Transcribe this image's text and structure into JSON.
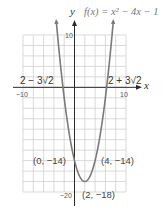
{
  "chart_data": {
    "type": "line",
    "function": "x^2 - 4x - 14",
    "xlabel": "x",
    "ylabel": "y",
    "xlim": [
      -10,
      10
    ],
    "ylim": [
      -20,
      10
    ],
    "grid": true,
    "grid_step": 2,
    "x_tick_labels": [
      {
        "value": -10,
        "label": "−10"
      },
      {
        "value": 10,
        "label": "10"
      }
    ],
    "y_tick_labels": [
      {
        "value": 10,
        "label": "10"
      },
      {
        "value": -20,
        "label": "−20"
      }
    ],
    "series": [
      {
        "name": "f(x) = x² − 4x − 14",
        "x_range": [
          -3.54,
          7.54
        ],
        "vertex": [
          2,
          -18
        ]
      }
    ],
    "annotations": [
      {
        "text": "2 − 3√2",
        "x": -2.24,
        "y": 0
      },
      {
        "text": "2 + 3√2",
        "x": 6.24,
        "y": 0
      },
      {
        "text": "(0, −14)",
        "x": 0,
        "y": -14
      },
      {
        "text": "(4, −14)",
        "x": 4,
        "y": -14
      },
      {
        "text": "(2, −18)",
        "x": 2,
        "y": -18
      }
    ]
  },
  "labels": {
    "y_axis": "y",
    "x_axis": "x",
    "function": "f(x) = x² − 4x − 1",
    "root_left": "2 − 3√2",
    "root_right": "2 + 3√2",
    "x_tick_min": "−10",
    "x_tick_max": "10",
    "y_tick_max": "10",
    "y_tick_min": "−20",
    "point_left": "(0, −14)",
    "point_right": "(4, −14)",
    "vertex": "(2, −18)"
  },
  "colors": {
    "grid": "#cfcfcf",
    "axis": "#2a2a2a",
    "curve": "#7a7a7a",
    "text": "#444444"
  }
}
